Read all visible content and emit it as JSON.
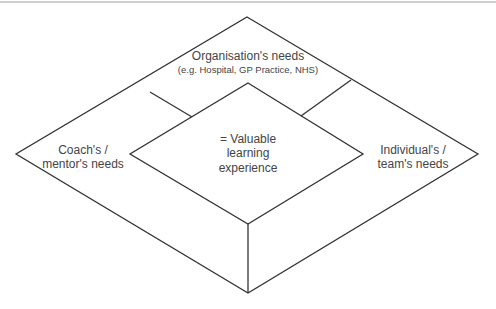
{
  "diagram": {
    "type": "nested-diamond",
    "line_color": "#333333",
    "text_color": "#444444",
    "regions": {
      "top": {
        "title": "Organisation's needs",
        "subtitle": "(e.g. Hospital, GP Practice, NHS)"
      },
      "left": {
        "line1": "Coach's /",
        "line2": "mentor's needs"
      },
      "right": {
        "line1": "Individual's /",
        "line2": "team's needs"
      },
      "center": {
        "line1": "= Valuable",
        "line2": "learning",
        "line3": "experience"
      }
    }
  }
}
